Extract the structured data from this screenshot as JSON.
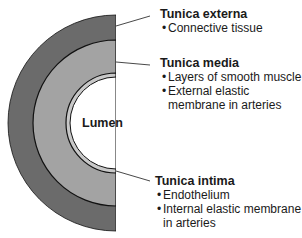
{
  "diagram": {
    "colors": {
      "tunica_externa": "#6b6b6b",
      "tunica_media": "#a3a3a3",
      "tunica_intima": "#c8c8c8",
      "lumen": "#ffffff",
      "outline": "#111111",
      "leader": "#333333"
    },
    "lumen_label": "Lumen",
    "layers": [
      {
        "title": "Tunica externa",
        "bullets": [
          "Connective tissue"
        ]
      },
      {
        "title": "Tunica media",
        "bullets": [
          "Layers of smooth muscle",
          "External elastic membrane in arteries"
        ]
      },
      {
        "title": "Tunica intima",
        "bullets": [
          "Endothelium",
          "Internal elastic membrane in arteries"
        ]
      }
    ]
  }
}
